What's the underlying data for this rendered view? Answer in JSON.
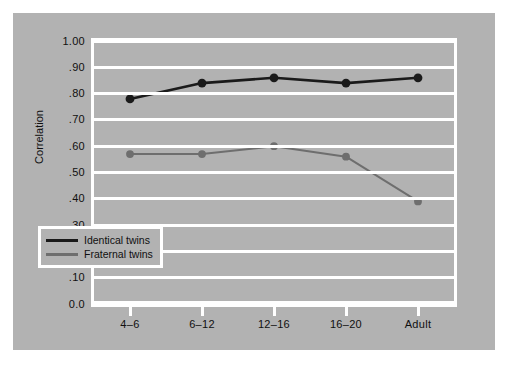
{
  "chart_data": {
    "type": "line",
    "title": "",
    "xlabel": "",
    "ylabel": "Correlation",
    "categories": [
      "4–6",
      "6–12",
      "12–16",
      "16–20",
      "Adult"
    ],
    "series": [
      {
        "name": "Identical twins",
        "color": "#1a1a1a",
        "values": [
          0.78,
          0.84,
          0.86,
          0.84,
          0.86
        ]
      },
      {
        "name": "Fraternal twins",
        "color": "#6e6e6e",
        "values": [
          0.57,
          0.57,
          0.6,
          0.56,
          0.39
        ]
      }
    ],
    "ylim": [
      0.0,
      1.0
    ],
    "ytick_values": [
      1.0,
      0.9,
      0.8,
      0.7,
      0.6,
      0.5,
      0.4,
      0.3,
      0.2,
      0.1,
      0.0
    ],
    "ytick_labels": [
      "1.00",
      ".90",
      ".80",
      ".70",
      ".60",
      ".50",
      ".40",
      ".30",
      ".20",
      ".10",
      "0.0"
    ],
    "grid": true,
    "legend_position": "bottom-left"
  },
  "axes": {
    "y_title": "Correlation",
    "y_ticks": [
      {
        "label": "1.00",
        "value": 1.0
      },
      {
        "label": ".90",
        "value": 0.9
      },
      {
        "label": ".80",
        "value": 0.8
      },
      {
        "label": ".70",
        "value": 0.7
      },
      {
        "label": ".60",
        "value": 0.6
      },
      {
        "label": ".50",
        "value": 0.5
      },
      {
        "label": ".40",
        "value": 0.4
      },
      {
        "label": ".30",
        "value": 0.3
      },
      {
        "label": ".20",
        "value": 0.2
      },
      {
        "label": ".10",
        "value": 0.1
      },
      {
        "label": "0.0",
        "value": 0.0
      }
    ],
    "x_ticks": [
      {
        "label": "4–6"
      },
      {
        "label": "6–12"
      },
      {
        "label": "12–16"
      },
      {
        "label": "16–20"
      },
      {
        "label": "Adult"
      }
    ]
  },
  "legend": {
    "items": [
      {
        "label": "Identical twins",
        "color": "#1a1a1a"
      },
      {
        "label": "Fraternal twins",
        "color": "#6e6e6e"
      }
    ]
  },
  "colors": {
    "figure_background": "#b2b2b2",
    "page_background": "#ffffff",
    "gridline": "#ffffff",
    "identical": "#1a1a1a",
    "fraternal": "#6e6e6e",
    "text": "#101010"
  }
}
